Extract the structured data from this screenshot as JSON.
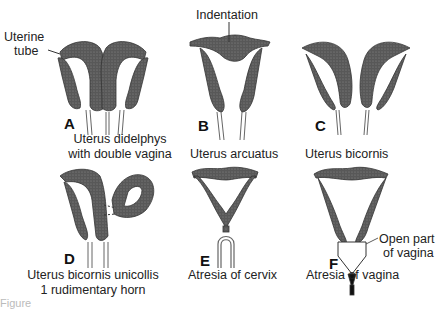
{
  "figure": {
    "panels": [
      {
        "letter": "A",
        "caption_line1": "Uterus didelphys",
        "caption_line2": "with double vagina"
      },
      {
        "letter": "B",
        "caption_line1": "Uterus arcuatus"
      },
      {
        "letter": "C",
        "caption_line1": "Uterus bicornis"
      },
      {
        "letter": "D",
        "caption_line1": "Uterus bicornis unicollis",
        "caption_line2": "1 rudimentary horn"
      },
      {
        "letter": "E",
        "caption_line1": "Atresia of cervix"
      },
      {
        "letter": "F",
        "caption_line1": "Atresia of vagina"
      }
    ],
    "annotations": {
      "uterine_tube_line1": "Uterine",
      "uterine_tube_line2": "tube",
      "indentation": "Indentation",
      "open_part_line1": "Open part",
      "open_part_line2": "of vagina"
    },
    "caption_partial": "Figure"
  }
}
